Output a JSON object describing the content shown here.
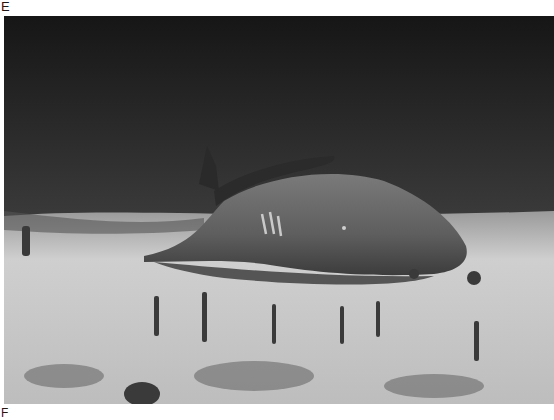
{
  "figure": {
    "panels": [
      {
        "label": "E",
        "description": "Underwater grayscale photograph of a ray/shark resting on a sandy seafloor with sparse sea grass and sponges; white tag marks on its back"
      },
      {
        "label": "F"
      }
    ]
  },
  "colors": {
    "water_dark": "#1e1e1e",
    "sand_light": "#d2d2d2",
    "animal_body": "#6a6a6a",
    "label_text": "#1a1a1a"
  }
}
